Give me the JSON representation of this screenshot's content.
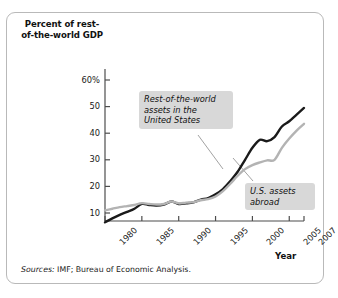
{
  "figure": {
    "y_axis_title": "Percent of\nrest-of-the-world\nGDP",
    "x_axis_title": "Year",
    "source_lead": "Sources:",
    "source_text": " IMF; Bureau of Economic Analysis."
  },
  "annotations": {
    "rest_of_world": "Rest-of-the-world\nassets in the\nUnited States",
    "us_assets": "U.S. assets\nabroad"
  },
  "colors": {
    "series_rest_of_world": "#1a1a1a",
    "series_us_assets": "#b3b3b3",
    "axis": "#4d4d4d",
    "callout_background": "#d8d8d8",
    "border": "#b9b9b9",
    "background": "#ffffff"
  },
  "chart_data": {
    "type": "line",
    "title": "",
    "xlabel": "Year",
    "ylabel": "Percent of rest-of-the-world GDP",
    "xlim": [
      1980,
      2007
    ],
    "ylim": [
      0,
      62
    ],
    "grid": false,
    "legend_position": "inline-callouts",
    "ytick_labels": [
      "60%",
      "50",
      "40",
      "30",
      "20",
      "10"
    ],
    "ytick_values": [
      60,
      50,
      40,
      30,
      20,
      10
    ],
    "xtick_labels": [
      "1980",
      "1985",
      "1990",
      "1995",
      "2000",
      "2005",
      "2007"
    ],
    "xtick_values": [
      1980,
      1985,
      1990,
      1995,
      2000,
      2005,
      2007
    ],
    "x": [
      1980,
      1981,
      1982,
      1983,
      1984,
      1985,
      1986,
      1987,
      1988,
      1989,
      1990,
      1991,
      1992,
      1993,
      1994,
      1995,
      1996,
      1997,
      1998,
      1999,
      2000,
      2001,
      2002,
      2003,
      2004,
      2005,
      2006,
      2007
    ],
    "series": [
      {
        "name": "Rest-of-the-world assets in the United States",
        "color": "#1a1a1a",
        "values": [
          6.5,
          8.0,
          9.3,
          10.4,
          11.6,
          13.4,
          13.0,
          12.8,
          13.2,
          14.3,
          13.4,
          13.6,
          14.0,
          15.0,
          15.6,
          17.0,
          19.0,
          22.0,
          25.5,
          30.0,
          34.5,
          37.5,
          37.0,
          38.5,
          42.5,
          44.5,
          47.0,
          49.5
        ]
      },
      {
        "name": "U.S. assets abroad",
        "color": "#b3b3b3",
        "values": [
          11.0,
          11.6,
          12.2,
          12.6,
          13.0,
          13.7,
          13.4,
          13.2,
          13.4,
          14.3,
          13.6,
          13.9,
          14.1,
          14.8,
          15.2,
          16.2,
          18.2,
          21.0,
          24.0,
          26.5,
          28.0,
          29.0,
          29.8,
          30.0,
          34.5,
          38.0,
          41.0,
          43.5
        ]
      }
    ]
  }
}
